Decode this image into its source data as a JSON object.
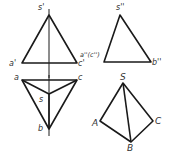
{
  "diagram": {
    "type": "orthographic projections of triangular pyramid",
    "front_view": {
      "labels": {
        "apex": "s'",
        "left": "a'",
        "right": "c'"
      }
    },
    "side_view": {
      "labels": {
        "apex": "s''",
        "left": "a''(c'')",
        "right": "b''"
      }
    },
    "top_view": {
      "labels": {
        "left": "a",
        "right": "c",
        "center": "s",
        "bottom": "b"
      }
    },
    "isometric_view": {
      "labels": {
        "apex": "S",
        "left": "A",
        "bottom": "B",
        "right": "C"
      }
    },
    "colors": {
      "line": "#1a1a1a",
      "text": "#333333",
      "background": "#ffffff"
    }
  }
}
